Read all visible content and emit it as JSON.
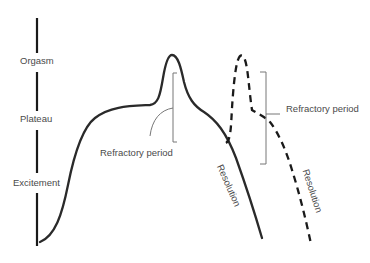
{
  "figure": {
    "type": "sexual-response-cycle-diagram",
    "axis_labels": [
      {
        "key": "orgasm",
        "text": "Orgasm"
      },
      {
        "key": "plateau",
        "text": "Plateau"
      },
      {
        "key": "excitement",
        "text": "Excitement"
      }
    ],
    "annotations": {
      "refractory_1": "Refractory period",
      "refractory_2": "Refractory period",
      "resolution_1": "Resolution",
      "resolution_2": "Resolution"
    },
    "curves": [
      {
        "name": "first-response",
        "style": "solid",
        "color": "#2a2a2a"
      },
      {
        "name": "second-response",
        "style": "dashed",
        "color": "#1a1a1a"
      }
    ],
    "colors": {
      "axis": "#1a1a1a",
      "bracket": "#6e6e6e",
      "text": "#4a4a4a"
    }
  }
}
